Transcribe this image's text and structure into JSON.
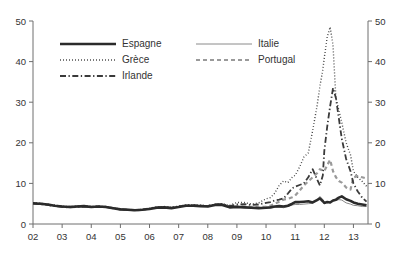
{
  "figure": {
    "top_note": "",
    "legend": {
      "entries": [
        {
          "label": "Espagne",
          "style": "solid-thick",
          "color": "#2b2b2b"
        },
        {
          "label": "Italie",
          "style": "solid-thin",
          "color": "#8a8a8a"
        },
        {
          "label": "Grèce",
          "style": "dotted",
          "color": "#3a3a3a"
        },
        {
          "label": "Portugal",
          "style": "dashed",
          "color": "#9a9a9a"
        },
        {
          "label": "Irlande",
          "style": "dash-dot",
          "color": "#3a3a3a"
        }
      ]
    }
  },
  "chart_data": {
    "type": "line",
    "title": "",
    "subtitle": "",
    "xlabel": "",
    "ylabel": "",
    "y2label": "",
    "grid": false,
    "legend_position": "top-left-inside",
    "xlim": [
      2002.0,
      2013.5
    ],
    "ylim": [
      0,
      50
    ],
    "y2lim": [
      0,
      50
    ],
    "yticks": [
      0,
      10,
      20,
      30,
      40,
      50
    ],
    "y2ticks": [
      0,
      10,
      20,
      30,
      40,
      50
    ],
    "xticks": [
      2002,
      2003,
      2004,
      2005,
      2006,
      2007,
      2008,
      2009,
      2010,
      2011,
      2012,
      2013
    ],
    "xticklabels": [
      "02",
      "03",
      "04",
      "05",
      "06",
      "07",
      "08",
      "09",
      "10",
      "11",
      "12",
      "13"
    ],
    "x": [
      2002.0,
      2002.25,
      2002.5,
      2002.75,
      2003.0,
      2003.25,
      2003.5,
      2003.75,
      2004.0,
      2004.25,
      2004.5,
      2004.75,
      2005.0,
      2005.25,
      2005.5,
      2005.75,
      2006.0,
      2006.25,
      2006.5,
      2006.75,
      2007.0,
      2007.25,
      2007.5,
      2007.75,
      2008.0,
      2008.25,
      2008.5,
      2008.75,
      2009.0,
      2009.25,
      2009.5,
      2009.75,
      2010.0,
      2010.15,
      2010.3,
      2010.45,
      2010.6,
      2010.75,
      2010.9,
      2011.0,
      2011.15,
      2011.3,
      2011.45,
      2011.6,
      2011.75,
      2011.85,
      2011.95,
      2012.0,
      2012.1,
      2012.2,
      2012.3,
      2012.4,
      2012.5,
      2012.6,
      2012.75,
      2012.9,
      2013.0,
      2013.15,
      2013.3,
      2013.45
    ],
    "series": [
      {
        "name": "Espagne",
        "style": "solid-thick",
        "color": "#2b2b2b",
        "width": 2.6,
        "values": [
          5.1,
          5.0,
          4.8,
          4.5,
          4.3,
          4.2,
          4.3,
          4.4,
          4.2,
          4.3,
          4.2,
          3.9,
          3.6,
          3.5,
          3.4,
          3.5,
          3.7,
          4.0,
          4.1,
          3.9,
          4.2,
          4.5,
          4.5,
          4.4,
          4.3,
          4.7,
          4.7,
          4.1,
          4.2,
          4.1,
          4.0,
          3.9,
          4.0,
          4.1,
          4.3,
          4.4,
          4.3,
          4.5,
          5.0,
          5.4,
          5.4,
          5.5,
          5.6,
          5.3,
          5.9,
          6.3,
          5.6,
          5.2,
          5.4,
          5.3,
          5.8,
          6.0,
          6.5,
          6.8,
          6.1,
          5.7,
          5.3,
          5.0,
          4.8,
          4.6
        ]
      },
      {
        "name": "Italie",
        "style": "solid-thin",
        "color": "#8a8a8a",
        "width": 1.0,
        "values": [
          5.0,
          4.9,
          4.7,
          4.4,
          4.2,
          4.1,
          4.2,
          4.3,
          4.2,
          4.3,
          4.2,
          3.9,
          3.7,
          3.6,
          3.4,
          3.5,
          3.8,
          4.1,
          4.2,
          4.0,
          4.3,
          4.6,
          4.6,
          4.5,
          4.4,
          4.8,
          4.8,
          4.3,
          4.4,
          4.3,
          4.1,
          4.0,
          4.1,
          4.0,
          4.1,
          4.2,
          4.0,
          4.3,
          4.7,
          4.8,
          4.8,
          4.9,
          5.0,
          5.1,
          5.9,
          6.8,
          6.0,
          5.5,
          5.2,
          5.4,
          5.7,
          5.8,
          6.0,
          5.9,
          5.2,
          4.9,
          4.6,
          4.5,
          4.3,
          4.3
        ]
      },
      {
        "name": "Grèce",
        "style": "dotted",
        "color": "#3a3a3a",
        "width": 1.4,
        "values": [
          5.2,
          5.1,
          4.9,
          4.6,
          4.4,
          4.3,
          4.4,
          4.5,
          4.3,
          4.4,
          4.3,
          4.0,
          3.7,
          3.6,
          3.5,
          3.6,
          3.9,
          4.2,
          4.3,
          4.1,
          4.4,
          4.7,
          4.7,
          4.6,
          4.5,
          4.9,
          5.0,
          4.6,
          5.3,
          5.3,
          4.9,
          5.2,
          6.2,
          6.5,
          7.6,
          9.5,
          10.6,
          10.2,
          11.5,
          12.0,
          14.0,
          16.5,
          17.5,
          23.0,
          29.0,
          34.0,
          38.0,
          41.0,
          46.0,
          48.5,
          44.0,
          31.0,
          28.0,
          25.0,
          20.0,
          17.0,
          13.0,
          11.5,
          10.5,
          9.3
        ]
      },
      {
        "name": "Portugal",
        "style": "dashed",
        "color": "#9a9a9a",
        "width": 2.2,
        "values": [
          5.1,
          5.0,
          4.8,
          4.5,
          4.3,
          4.2,
          4.3,
          4.4,
          4.2,
          4.3,
          4.2,
          3.9,
          3.6,
          3.5,
          3.4,
          3.5,
          3.8,
          4.1,
          4.2,
          4.0,
          4.3,
          4.6,
          4.6,
          4.5,
          4.4,
          4.8,
          4.8,
          4.3,
          4.4,
          4.3,
          4.2,
          4.1,
          4.3,
          4.5,
          5.0,
          5.5,
          6.0,
          6.2,
          6.6,
          7.0,
          8.2,
          9.5,
          10.5,
          11.5,
          12.5,
          13.5,
          13.2,
          13.0,
          14.5,
          15.8,
          13.0,
          11.5,
          10.6,
          10.2,
          9.0,
          8.5,
          11.5,
          11.8,
          11.5,
          11.2
        ]
      },
      {
        "name": "Irlande",
        "style": "dash-dot",
        "color": "#3a3a3a",
        "width": 1.8,
        "values": [
          5.0,
          4.9,
          4.7,
          4.4,
          4.2,
          4.1,
          4.2,
          4.3,
          4.2,
          4.3,
          4.2,
          3.9,
          3.6,
          3.5,
          3.4,
          3.5,
          3.8,
          4.1,
          4.2,
          4.0,
          4.3,
          4.6,
          4.6,
          4.5,
          4.4,
          4.8,
          4.9,
          4.4,
          4.8,
          4.9,
          4.7,
          4.8,
          5.2,
          5.4,
          5.8,
          6.0,
          6.3,
          7.5,
          8.8,
          9.2,
          9.6,
          10.0,
          11.5,
          13.5,
          11.0,
          9.5,
          12.0,
          18.0,
          24.0,
          29.0,
          33.5,
          31.0,
          26.0,
          21.0,
          16.0,
          13.0,
          10.0,
          8.0,
          6.5,
          5.5
        ]
      }
    ]
  }
}
